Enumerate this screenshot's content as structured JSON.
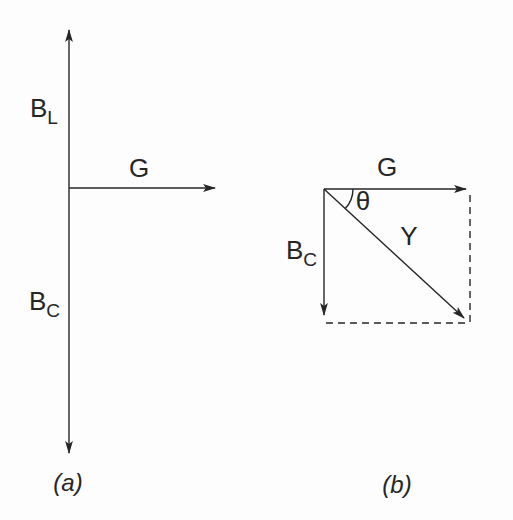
{
  "figure": {
    "background_color": "#fdfdfd",
    "ink_color": "#262626",
    "diagram_a": {
      "caption": "(a)",
      "label_bl_main": "B",
      "label_bl_sub": "L",
      "label_bc_main": "B",
      "label_bc_sub": "C",
      "label_g": "G"
    },
    "diagram_b": {
      "caption": "(b)",
      "label_g": "G",
      "label_theta": "θ",
      "label_y": "Y",
      "label_bc_main": "B",
      "label_bc_sub": "C"
    }
  }
}
